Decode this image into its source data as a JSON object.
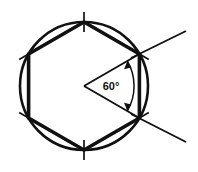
{
  "figure": {
    "background_color": "#ffffff",
    "stroke_color": "#111111",
    "labels": {
      "central_angle": "60°"
    },
    "geometry": {
      "circle": {
        "center_x": 84,
        "center_y": 86,
        "radius": 64,
        "stroke_width": 2.6
      },
      "hexagon": {
        "sides": 6,
        "center_x": 84,
        "center_y": 86,
        "circumradius": 64,
        "vertex_angles_deg": [
          270,
          330,
          30,
          90,
          150,
          210
        ],
        "stroke_width": 3.4,
        "vertices": [
          {
            "name": "top",
            "x": 84,
            "y": 22
          },
          {
            "name": "upper-right",
            "x": 139.4,
            "y": 54
          },
          {
            "name": "lower-right",
            "x": 139.4,
            "y": 118
          },
          {
            "name": "bottom",
            "x": 84,
            "y": 150
          },
          {
            "name": "lower-left",
            "x": 28.6,
            "y": 118
          },
          {
            "name": "upper-left",
            "x": 28.6,
            "y": 54
          }
        ]
      },
      "tick_marks": {
        "count": 6,
        "length": 20,
        "stroke_width": 1.7,
        "description": "short stroke crossing each hexagon vertex"
      },
      "central_angle": {
        "apex_x": 84,
        "apex_y": 86,
        "value_deg": 60,
        "ray_from": "upper-right vertex",
        "ray_to": "lower-right vertex",
        "arc_radius": 50,
        "arrowheads": 2,
        "label_x": 111,
        "label_y": 90
      },
      "extension_rays": [
        {
          "name": "upper-right-ray",
          "x1": 139.4,
          "y1": 54,
          "x2": 186,
          "y2": 31
        },
        {
          "name": "lower-right-ray",
          "x1": 139.4,
          "y1": 118,
          "x2": 186,
          "y2": 142
        }
      ]
    }
  }
}
